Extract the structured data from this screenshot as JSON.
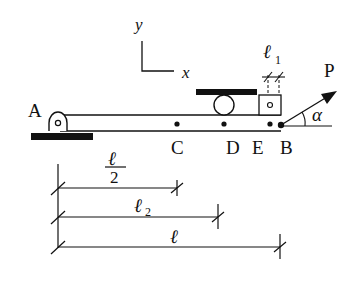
{
  "diagram": {
    "type": "mechanics-beam-figure",
    "axes": {
      "y_label": "y",
      "x_label": "x"
    },
    "points": {
      "A": "A",
      "C": "C",
      "D": "D",
      "E": "E",
      "B": "B"
    },
    "force": {
      "label": "P",
      "angle_label": "α"
    },
    "dimensions": {
      "l1_label": "ℓ",
      "l1_sub": "1",
      "half_l_num": "ℓ",
      "half_l_den": "2",
      "l2_label": "ℓ",
      "l2_sub": "2",
      "l_label": "ℓ"
    },
    "colors": {
      "line": "#111111",
      "background": "#ffffff"
    }
  }
}
